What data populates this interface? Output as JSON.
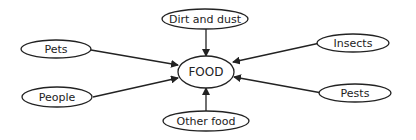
{
  "diagram": {
    "center": {
      "label": "FOOD"
    },
    "nodes": [
      {
        "id": "dirt",
        "label": "Dirt and dust"
      },
      {
        "id": "pets",
        "label": "Pets"
      },
      {
        "id": "insects",
        "label": "Insects"
      },
      {
        "id": "people",
        "label": "People"
      },
      {
        "id": "pests",
        "label": "Pests"
      },
      {
        "id": "other",
        "label": "Other food"
      }
    ],
    "edges": [
      {
        "from": "dirt",
        "to": "center"
      },
      {
        "from": "pets",
        "to": "center"
      },
      {
        "from": "insects",
        "to": "center"
      },
      {
        "from": "people",
        "to": "center"
      },
      {
        "from": "pests",
        "to": "center"
      },
      {
        "from": "other",
        "to": "center"
      }
    ]
  }
}
